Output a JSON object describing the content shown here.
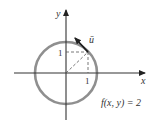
{
  "diagram": {
    "type": "level-curve-with-direction-vector",
    "axes": {
      "x_label": "x",
      "y_label": "y"
    },
    "circle": {
      "description": "level curve",
      "color": "#8c8c8c"
    },
    "point_coords": {
      "x_tick_label": "1",
      "y_tick_label": "1"
    },
    "vector": {
      "label": "u⃗",
      "label_text": "ū",
      "color": "#1a1a1a"
    },
    "equation": "f(x, y) = 2",
    "colors": {
      "axis": "#333333",
      "circle": "#8c8c8c",
      "dashed": "#555555",
      "text": "#333333"
    }
  }
}
